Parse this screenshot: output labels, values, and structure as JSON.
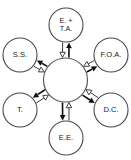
{
  "diagram": {
    "type": "radial-hub-bidirectional",
    "title": "",
    "background_color": "#ffffff",
    "hub": {
      "label": "",
      "cx": 65.5,
      "cy": 80,
      "r": 22
    },
    "node_radius": 17,
    "nodes": [
      {
        "id": "top",
        "lines": [
          "E. +",
          "T.A."
        ],
        "cx": 66,
        "cy": 25,
        "angle_deg": -90
      },
      {
        "id": "upper-right",
        "lines": [
          "F.O.A."
        ],
        "cx": 111,
        "cy": 55,
        "angle_deg": -33
      },
      {
        "id": "lower-right",
        "lines": [
          "D.C."
        ],
        "cx": 111,
        "cy": 110,
        "angle_deg": 33
      },
      {
        "id": "bottom",
        "lines": [
          "E.E."
        ],
        "cx": 66,
        "cy": 138,
        "angle_deg": 90
      },
      {
        "id": "lower-left",
        "lines": [
          "T."
        ],
        "cx": 20,
        "cy": 110,
        "angle_deg": 147
      },
      {
        "id": "upper-left",
        "lines": [
          "S.S."
        ],
        "cx": 20,
        "cy": 55,
        "angle_deg": 213
      }
    ],
    "connector": {
      "style": "bidirectional-pair",
      "outward_arrow": "solid-filled",
      "inward_arrow": "hollow-outlined",
      "outward_color": "#111111",
      "inward_color": "#2a2a2a"
    }
  }
}
